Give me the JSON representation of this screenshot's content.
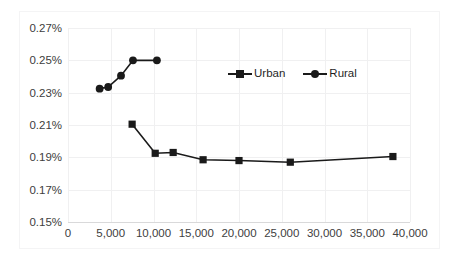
{
  "chart_data": {
    "type": "line",
    "title": "",
    "subtitle": "",
    "xlabel": "",
    "ylabel": "",
    "xlim": [
      0,
      40000
    ],
    "ylim": [
      0.15,
      0.27
    ],
    "grid": true,
    "legend_position": "upper-center-right",
    "y_tick_labels": [
      "0.27%",
      "0.25%",
      "0.23%",
      "0.21%",
      "0.19%",
      "0.17%",
      "0.15%"
    ],
    "y_tick_values": [
      0.27,
      0.25,
      0.23,
      0.21,
      0.19,
      0.17,
      0.15
    ],
    "x_tick_labels": [
      "0",
      "5,000",
      "10,000",
      "15,000",
      "20,000",
      "25,000",
      "30,000",
      "35,000",
      "40,000"
    ],
    "x_tick_values": [
      0,
      5000,
      10000,
      15000,
      20000,
      25000,
      30000,
      35000,
      40000
    ],
    "series": [
      {
        "name": "Urban",
        "marker": "square",
        "color": "#1a1a1a",
        "points": [
          {
            "x": 7500,
            "y": 0.2105
          },
          {
            "x": 10200,
            "y": 0.1925
          },
          {
            "x": 12300,
            "y": 0.193
          },
          {
            "x": 15800,
            "y": 0.1885
          },
          {
            "x": 20000,
            "y": 0.188
          },
          {
            "x": 26000,
            "y": 0.187
          },
          {
            "x": 38000,
            "y": 0.1905
          }
        ]
      },
      {
        "name": "Rural",
        "marker": "circle",
        "color": "#1a1a1a",
        "points": [
          {
            "x": 3700,
            "y": 0.2325
          },
          {
            "x": 4700,
            "y": 0.2335
          },
          {
            "x": 6200,
            "y": 0.2405
          },
          {
            "x": 7600,
            "y": 0.25
          },
          {
            "x": 10400,
            "y": 0.25
          }
        ]
      }
    ]
  },
  "legend": {
    "entries": [
      {
        "label": "Urban",
        "marker": "square"
      },
      {
        "label": "Rural",
        "marker": "circle"
      }
    ]
  }
}
